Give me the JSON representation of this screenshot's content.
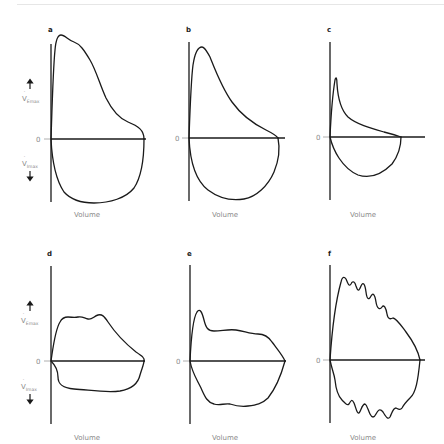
{
  "figure": {
    "panels": [
      {
        "letter": "a",
        "x_label": "Volume",
        "zero_label": "0",
        "has_y_labels": true
      },
      {
        "letter": "b",
        "x_label": "Volume",
        "zero_label": "0",
        "has_y_labels": false
      },
      {
        "letter": "c",
        "x_label": "Volume",
        "zero_label": "0",
        "has_y_labels": false
      },
      {
        "letter": "d",
        "x_label": "Volume",
        "zero_label": "0",
        "has_y_labels": true
      },
      {
        "letter": "e",
        "x_label": "Volume",
        "zero_label": "0",
        "has_y_labels": false
      },
      {
        "letter": "f",
        "x_label": "Volume",
        "zero_label": "0",
        "has_y_labels": false
      }
    ],
    "y_labels": {
      "upper_symbol": "V",
      "upper_sub": "Emax",
      "lower_symbol": "V",
      "lower_sub": "Imax",
      "upper_arrow": "up-arrow",
      "lower_arrow": "down-arrow"
    },
    "colors": {
      "curve": "#1a1a1a",
      "label_gray": "#8a8a8a",
      "background": "#ffffff"
    }
  }
}
